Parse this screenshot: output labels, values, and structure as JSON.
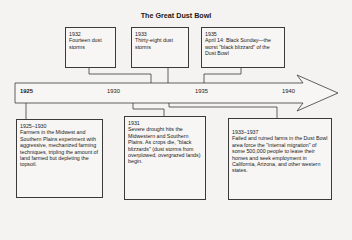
{
  "title": "The Great Dust Bowl",
  "timeline": {
    "ticks": [
      "1925",
      "1930",
      "1935",
      "1940"
    ]
  },
  "events_top": [
    {
      "year": "1932",
      "text": "Fourteen dust storms"
    },
    {
      "year": "1933",
      "text": "Thirty-eight dust storms"
    },
    {
      "year": "1935",
      "text": "April 14: Black Sunday—the worst \"black blizzard\" of the Dust Bowl"
    }
  ],
  "events_bottom": [
    {
      "year": "1925–1930",
      "text": "Farmers in the Midwest and Southern Plains experiment with aggressive, mechanized farming techniques, tripling the amount of land farmed but depleting the topsoil."
    },
    {
      "year": "1931",
      "text": "Severe drought hits the Midwestern and Southern Plains. As crops die, \"black blizzards\" (dust storms from overplowed, overgrazed lands) begin."
    },
    {
      "year": "1933–1937",
      "text": "Failed and ruined farms in the Dust Bowl area force the \"internal migration\" of some 500,000 people to leave their homes and seek employment in California, Arizona, and other western states."
    }
  ]
}
